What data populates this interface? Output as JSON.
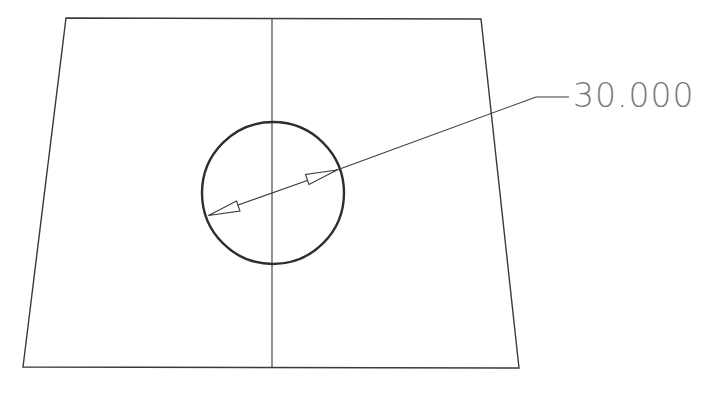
{
  "drawing": {
    "type": "technical-drawing",
    "line_color": "#3a3a3a",
    "text_color": "#7a7a7a",
    "background": "#ffffff",
    "part_outline": {
      "shape": "trapezoid",
      "points": [
        [
          66,
          18
        ],
        [
          481,
          19
        ],
        [
          519,
          368
        ],
        [
          23,
          367
        ]
      ]
    },
    "center_line": {
      "x": 272,
      "y1": 18,
      "y2": 368
    },
    "hole": {
      "shape": "circle",
      "cx": 273,
      "cy": 193,
      "r": 71
    },
    "diameter_dimension": {
      "value_label": "30.000",
      "arrow_tip_1": [
        208.5,
        215.5
      ],
      "arrow_tip_2": [
        337,
        170
      ],
      "leader_elbow": [
        536,
        97
      ],
      "leader_end": [
        569,
        97
      ],
      "label_position": [
        573,
        107
      ]
    }
  }
}
